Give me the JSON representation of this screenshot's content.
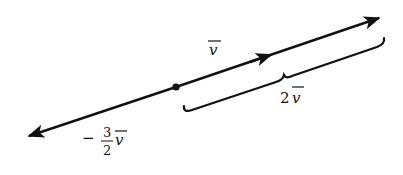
{
  "diagram": {
    "origin_point": {
      "x": 176,
      "y": 87
    },
    "line": {
      "start": {
        "x": 27,
        "y": 137
      },
      "end": {
        "x": 381,
        "y": 17
      }
    },
    "labels": {
      "v": {
        "text": "v",
        "overline": true
      },
      "two_v": {
        "coef": "2",
        "var": "v",
        "overline": true
      },
      "neg_three_halves_v": {
        "sign": "−",
        "numerator": "3",
        "denominator": "2",
        "var": "v",
        "overline": true
      }
    },
    "colors": {
      "stroke": "#111111",
      "background": "#ffffff"
    }
  }
}
